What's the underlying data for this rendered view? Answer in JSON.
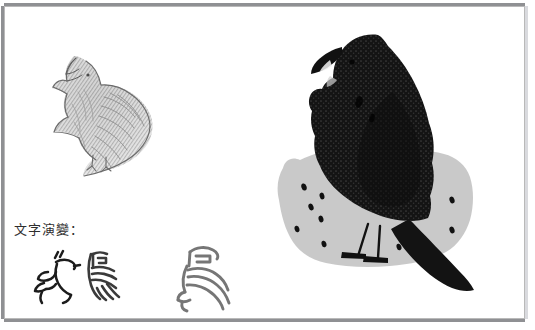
{
  "page": {
    "width": 535,
    "height": 330,
    "background_color": "#ffffff",
    "frame_color": "#8f9093"
  },
  "caption": {
    "text": "文字演變：",
    "meaning": "Character evolution:",
    "color": "#2e2e2e"
  },
  "artwork": {
    "pencil_sketch": {
      "label": "pencil sketch of a calling crow",
      "description": "graphite sketch of a crow with head raised and beak open, body angled down-right",
      "ink_color": "#8a8a8a",
      "x": 28,
      "y": 50,
      "width": 125,
      "height": 125
    },
    "ink_crow": {
      "label": "black ink crow standing on ground",
      "body_color": "#1a1a1a",
      "texture_color": "#2f2f2f",
      "x": 300,
      "y": 32,
      "width": 190,
      "height": 262
    },
    "ground_patch": {
      "label": "gray ground patch with scattered seeds",
      "fill_color": "#c3c3c3",
      "dot_color": "#111111",
      "dot_count": 9
    }
  },
  "glyphs": [
    {
      "name": "oracle-bone-script",
      "stage": "甲骨文",
      "ink_color": "#1c1c1c",
      "x": 18,
      "y": 252,
      "width": 62,
      "height": 50
    },
    {
      "name": "bronze-script",
      "stage": "金文",
      "ink_color": "#3a3a3a",
      "x": 78,
      "y": 250,
      "width": 48,
      "height": 52
    },
    {
      "name": "seal-script",
      "stage": "篆書",
      "ink_color": "#6d6d6d",
      "x": 180,
      "y": 240,
      "width": 52,
      "height": 66
    }
  ]
}
